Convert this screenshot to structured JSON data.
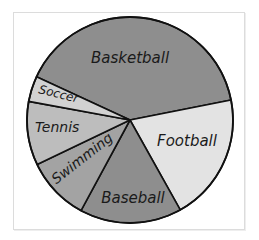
{
  "chart_data": {
    "type": "pie",
    "title": "",
    "start_angle_deg": 204.8,
    "direction": "clockwise",
    "slices": [
      {
        "label": "Basketball",
        "value": 40,
        "color": "#8e8e8e"
      },
      {
        "label": "Football",
        "value": 20,
        "color": "#e3e3e3"
      },
      {
        "label": "Baseball",
        "value": 16,
        "color": "#8e8e8e"
      },
      {
        "label": "Swimming",
        "value": 10,
        "color": "#a3a3a3"
      },
      {
        "label": "Tennis",
        "value": 10,
        "color": "#bdbdbd"
      },
      {
        "label": "Soccer",
        "value": 4,
        "color": "#d2d2d2"
      }
    ],
    "categories": [
      "Basketball",
      "Football",
      "Baseball",
      "Swimming",
      "Tennis",
      "Soccer"
    ],
    "values": [
      40,
      20,
      16,
      10,
      10,
      4
    ],
    "legend": "none (labels inside slices)",
    "value_labels_shown": false
  },
  "labels": {
    "basketball": "Basketball",
    "football": "Football",
    "baseball": "Baseball",
    "swimming": "Swimming",
    "tennis": "Tennis",
    "soccer": "Soccer"
  }
}
